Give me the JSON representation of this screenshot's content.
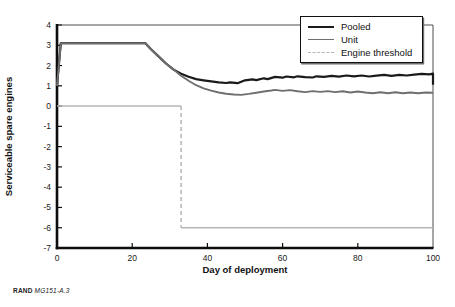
{
  "chart_data": {
    "type": "line",
    "title": "",
    "xlabel": "Day of deployment",
    "ylabel": "Serviceable spare engines",
    "xlim": [
      0,
      100
    ],
    "ylim": [
      -7,
      4
    ],
    "x_ticks": [
      0,
      20,
      40,
      60,
      80,
      100
    ],
    "y_ticks": [
      4,
      3,
      2,
      1,
      0,
      -1,
      -2,
      -3,
      -4,
      -5,
      -6,
      -7
    ],
    "grid": false,
    "legend_position": "top-right",
    "colors": {
      "axis": "#0d0d0d",
      "frame": "#4d4d4d",
      "tick_text": "#1a1a1a",
      "background": "#ffffff"
    },
    "series": [
      {
        "name": "Pooled",
        "color": "#1a1a1a",
        "stroke_width": 2.2,
        "legend_dash": false,
        "points": [
          [
            0,
            1.0
          ],
          [
            1,
            3.1
          ],
          [
            23.5,
            3.1
          ],
          [
            25,
            2.8
          ],
          [
            27,
            2.45
          ],
          [
            29,
            2.1
          ],
          [
            31,
            1.8
          ],
          [
            33,
            1.6
          ],
          [
            35,
            1.45
          ],
          [
            37,
            1.33
          ],
          [
            39,
            1.27
          ],
          [
            41,
            1.22
          ],
          [
            43,
            1.17
          ],
          [
            45,
            1.14
          ],
          [
            46,
            1.17
          ],
          [
            48,
            1.13
          ],
          [
            50,
            1.27
          ],
          [
            52,
            1.32
          ],
          [
            53,
            1.28
          ],
          [
            55,
            1.37
          ],
          [
            56,
            1.33
          ],
          [
            58,
            1.44
          ],
          [
            60,
            1.4
          ],
          [
            61,
            1.46
          ],
          [
            63,
            1.42
          ],
          [
            64,
            1.47
          ],
          [
            66,
            1.43
          ],
          [
            68,
            1.41
          ],
          [
            69,
            1.47
          ],
          [
            71,
            1.44
          ],
          [
            73,
            1.49
          ],
          [
            75,
            1.45
          ],
          [
            77,
            1.51
          ],
          [
            79,
            1.47
          ],
          [
            81,
            1.51
          ],
          [
            83,
            1.46
          ],
          [
            85,
            1.5
          ],
          [
            87,
            1.54
          ],
          [
            89,
            1.49
          ],
          [
            91,
            1.54
          ],
          [
            93,
            1.51
          ],
          [
            95,
            1.55
          ],
          [
            97,
            1.59
          ],
          [
            99,
            1.57
          ],
          [
            100,
            1.6
          ],
          [
            100,
            1.05
          ]
        ]
      },
      {
        "name": "Unit",
        "color": "#6f6f6f",
        "stroke_width": 1.9,
        "legend_dash": false,
        "points": [
          [
            0,
            1.0
          ],
          [
            1,
            3.1
          ],
          [
            23.5,
            3.1
          ],
          [
            25,
            2.8
          ],
          [
            27,
            2.45
          ],
          [
            29,
            2.1
          ],
          [
            31,
            1.8
          ],
          [
            33,
            1.5
          ],
          [
            35,
            1.25
          ],
          [
            37,
            1.03
          ],
          [
            39,
            0.88
          ],
          [
            41,
            0.76
          ],
          [
            43,
            0.67
          ],
          [
            45,
            0.61
          ],
          [
            47,
            0.57
          ],
          [
            49,
            0.55
          ],
          [
            51,
            0.6
          ],
          [
            53,
            0.66
          ],
          [
            55,
            0.72
          ],
          [
            57,
            0.77
          ],
          [
            58,
            0.8
          ],
          [
            60,
            0.75
          ],
          [
            62,
            0.79
          ],
          [
            64,
            0.73
          ],
          [
            66,
            0.69
          ],
          [
            68,
            0.74
          ],
          [
            70,
            0.7
          ],
          [
            72,
            0.74
          ],
          [
            74,
            0.69
          ],
          [
            76,
            0.73
          ],
          [
            78,
            0.67
          ],
          [
            80,
            0.72
          ],
          [
            82,
            0.67
          ],
          [
            84,
            0.63
          ],
          [
            86,
            0.68
          ],
          [
            88,
            0.63
          ],
          [
            90,
            0.68
          ],
          [
            92,
            0.63
          ],
          [
            94,
            0.67
          ],
          [
            96,
            0.63
          ],
          [
            98,
            0.67
          ],
          [
            100,
            0.66
          ]
        ]
      },
      {
        "name": "Engine threshold",
        "color": "#b5b5b5",
        "stroke_width": 1.5,
        "legend_dash": true,
        "segments": [
          {
            "dash": false,
            "points": [
              [
                0,
                0
              ],
              [
                33,
                0
              ]
            ]
          },
          {
            "dash": true,
            "points": [
              [
                33,
                0
              ],
              [
                33,
                -6
              ]
            ]
          },
          {
            "dash": false,
            "points": [
              [
                33,
                -6
              ],
              [
                100,
                -6
              ]
            ]
          }
        ]
      }
    ]
  },
  "footer": {
    "brand": "RAND",
    "doc": "MG151-A.3"
  }
}
